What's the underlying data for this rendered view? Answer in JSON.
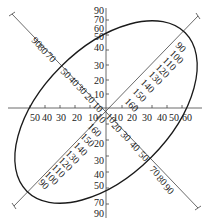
{
  "diagram": {
    "type": "polar-axes-with-ellipse",
    "center": {
      "x": 106,
      "y": 108
    },
    "horizontal_axis": {
      "right_labels": [
        "10",
        "20",
        "30",
        "40",
        "50",
        "60"
      ],
      "left_labels": [
        "10",
        "20",
        "30",
        "40",
        "50"
      ]
    },
    "vertical_axis": {
      "top_labels": [
        "10",
        "20",
        "30",
        "40",
        "50",
        "60",
        "70",
        "90"
      ],
      "bottom_labels": [
        "20",
        "30",
        "40",
        "50",
        "70",
        "90"
      ]
    },
    "diagonal_upper_left": {
      "labels": [
        "10",
        "20",
        "30",
        "40",
        "50",
        "70",
        "80",
        "90"
      ]
    },
    "diagonal_lower_right": {
      "labels": [
        "10",
        "20",
        "30",
        "40",
        "50",
        "70",
        "80",
        "90"
      ]
    },
    "diagonal_upper_right": {
      "labels": [
        "160",
        "150",
        "140",
        "130",
        "120",
        "110",
        "100",
        "90"
      ]
    },
    "diagonal_lower_left": {
      "labels": [
        "10",
        "160",
        "150",
        "140",
        "130",
        "120",
        "110",
        "100",
        "90"
      ]
    },
    "ellipse": {
      "rotation_deg": -45,
      "rx": 112,
      "ry": 64
    },
    "colors": {
      "line": "#333333",
      "curve": "#1a1a1a",
      "text": "#222222"
    }
  }
}
